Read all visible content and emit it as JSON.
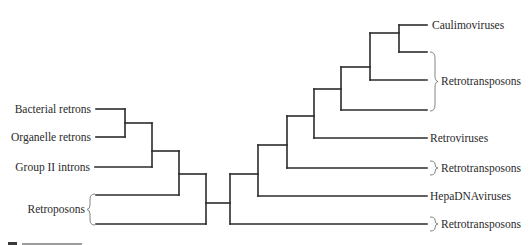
{
  "diagram": {
    "type": "phylogenetic-tree",
    "stroke_color": "#2b2b2b",
    "left_clade": {
      "labels": [
        {
          "id": "bacterial-retrons",
          "text": "Bacterial retrons"
        },
        {
          "id": "organelle-retrons",
          "text": "Organelle retrons"
        },
        {
          "id": "group-ii-introns",
          "text": "Group II introns"
        },
        {
          "id": "retroposons",
          "text": "Retroposons",
          "bracketed": true,
          "branches": 2
        }
      ]
    },
    "right_clade": {
      "labels": [
        {
          "id": "caulimoviruses",
          "text": "Caulimoviruses"
        },
        {
          "id": "retrotransposons-1",
          "text": "Retrotransposons",
          "bracketed": true,
          "branches": 2
        },
        {
          "id": "retroviruses",
          "text": "Retroviruses"
        },
        {
          "id": "retrotransposons-2",
          "text": "Retrotransposons",
          "bracketed": true,
          "branches": 1
        },
        {
          "id": "hepadnaviruses",
          "text": "HepaDNAviruses"
        },
        {
          "id": "retrotransposons-3",
          "text": "Retrotransposons",
          "bracketed": true,
          "branches": 1
        }
      ]
    }
  }
}
